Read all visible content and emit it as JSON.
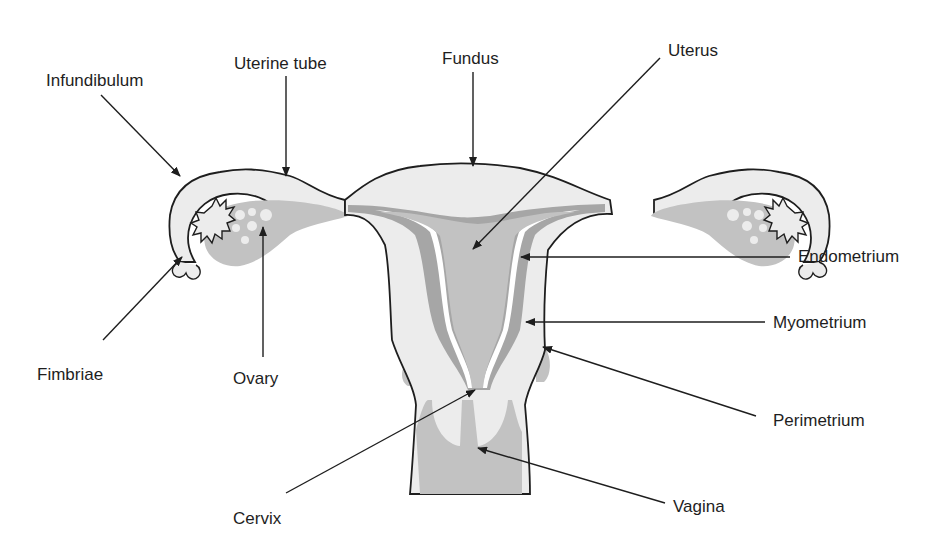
{
  "diagram": {
    "colors": {
      "background": "#ffffff",
      "tissue_light": "#ececec",
      "tissue_mid": "#c2c2c2",
      "tissue_dark": "#a6a6a6",
      "outline": "#1e1e1e",
      "text": "#1e1e1e"
    },
    "labels": {
      "infundibulum": "Infundibulum",
      "uterine_tube": "Uterine tube",
      "fundus": "Fundus",
      "uterus": "Uterus",
      "endometrium": "Endometrium",
      "myometrium": "Myometrium",
      "perimetrium": "Perimetrium",
      "fimbriae": "Fimbriae",
      "ovary": "Ovary",
      "cervix": "Cervix",
      "vagina": "Vagina"
    }
  }
}
